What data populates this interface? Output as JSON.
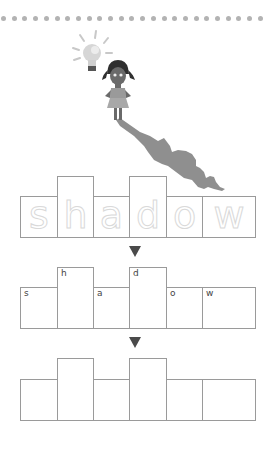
{
  "worksheet": {
    "word": "shadow",
    "letters": [
      "s",
      "h",
      "a",
      "d",
      "o",
      "w"
    ],
    "box_heights": [
      "short",
      "tall",
      "short",
      "tall",
      "short",
      "short"
    ],
    "rows": [
      {
        "name": "trace-row",
        "style": "dotted-trace",
        "letters": [
          "s",
          "h",
          "a",
          "d",
          "o",
          "w"
        ]
      },
      {
        "name": "copy-row",
        "style": "small-labels",
        "letters": [
          "s",
          "h",
          "a",
          "d",
          "o",
          "w"
        ]
      },
      {
        "name": "write-row",
        "style": "blank",
        "letters": [
          "",
          "",
          "",
          "",
          "",
          ""
        ]
      }
    ],
    "arrows": [
      "down-arrow-1",
      "down-arrow-2"
    ],
    "illustration": {
      "items": [
        "lightbulb-icon",
        "girl-figure",
        "shadow-shape"
      ]
    },
    "colors": {
      "box_border": "#9a9a9a",
      "trace_letters": "#d9d9d9",
      "arrow": "#4a4a4a",
      "dots": "#b3b3b3",
      "shadow": "#8a8a8a"
    }
  }
}
